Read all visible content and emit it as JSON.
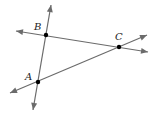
{
  "diagram": {
    "type": "geometry",
    "colors": {
      "line": "#6b6b6b",
      "point": "#000000",
      "label": "#222222"
    },
    "points": [
      {
        "name": "B",
        "label": "B",
        "x": 46,
        "y": 35,
        "label_x": 34,
        "label_y": 30
      },
      {
        "name": "C",
        "label": "C",
        "x": 119,
        "y": 47,
        "label_x": 115,
        "label_y": 40
      },
      {
        "name": "A",
        "label": "A",
        "x": 38,
        "y": 82,
        "label_x": 25,
        "label_y": 80
      }
    ],
    "lines": [
      {
        "name": "line-AB",
        "through": [
          "A",
          "B"
        ],
        "x1": 33,
        "y1": 110,
        "x2": 51,
        "y2": 5
      },
      {
        "name": "line-BC",
        "through": [
          "B",
          "C"
        ],
        "x1": 16,
        "y1": 31,
        "x2": 148,
        "y2": 52
      },
      {
        "name": "line-AC",
        "through": [
          "A",
          "C"
        ],
        "x1": 10,
        "y1": 93,
        "x2": 147,
        "y2": 35
      }
    ]
  }
}
